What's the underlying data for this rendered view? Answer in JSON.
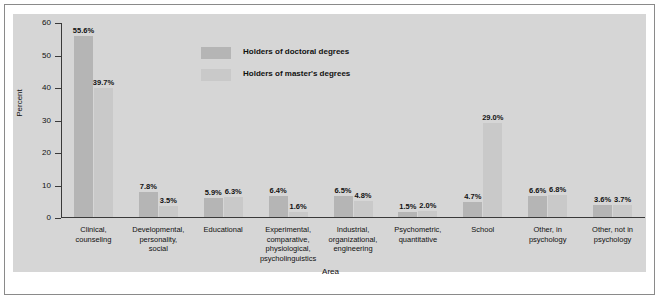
{
  "chart_data": {
    "type": "bar",
    "title": "",
    "subtitle": "",
    "xlabel": "Area",
    "ylabel": "Percent",
    "ylim": [
      0,
      60
    ],
    "yticks": [
      0,
      10,
      20,
      30,
      40,
      50,
      60
    ],
    "grid": false,
    "legend_position": "inside-top-center",
    "categories": [
      "Clinical,\ncounseling",
      "Developmental,\npersonality,\nsocial",
      "Educational",
      "Experimental,\ncomparative,\nphysiological,\npsycholinguistics",
      "Industrial,\norganizational,\nengineering",
      "Psychometric,\nquantitative",
      "School",
      "Other, in\npsychology",
      "Other, not in\npsychology"
    ],
    "series": [
      {
        "name": "Holders of doctoral degrees",
        "color": "#b5b5b5",
        "values": [
          55.6,
          7.8,
          5.9,
          6.4,
          6.5,
          1.5,
          4.7,
          6.6,
          3.6
        ],
        "labels": [
          "55.6%",
          "7.8%",
          "5.9%",
          "6.4%",
          "6.5%",
          "1.5%",
          "4.7%",
          "6.6%",
          "3.6%"
        ]
      },
      {
        "name": "Holders of master's degrees",
        "color": "#c9c9c9",
        "values": [
          39.7,
          3.5,
          6.3,
          1.6,
          4.8,
          2.0,
          29.0,
          6.8,
          3.7
        ],
        "labels": [
          "39.7%",
          "3.5%",
          "6.3%",
          "1.6%",
          "4.8%",
          "2.0%",
          "29.0%",
          "6.8%",
          "3.7%"
        ]
      }
    ]
  },
  "legend": {
    "items": [
      {
        "label": "Holders of doctoral degrees",
        "color": "#b5b5b5"
      },
      {
        "label": "Holders of master's degrees",
        "color": "#c9c9c9"
      }
    ]
  },
  "axis": {
    "y_title": "Percent",
    "x_title": "Area",
    "y_tick_labels": [
      "0",
      "10",
      "20",
      "30",
      "40",
      "50",
      "60"
    ]
  },
  "colors": {
    "plot_background": "#d6d6d6",
    "figure_background": "#ffffff",
    "border": "#8a8a8a",
    "axis": "#3a3a3a",
    "doctoral": "#b5b5b5",
    "masters": "#c9c9c9",
    "text": "#111111"
  }
}
